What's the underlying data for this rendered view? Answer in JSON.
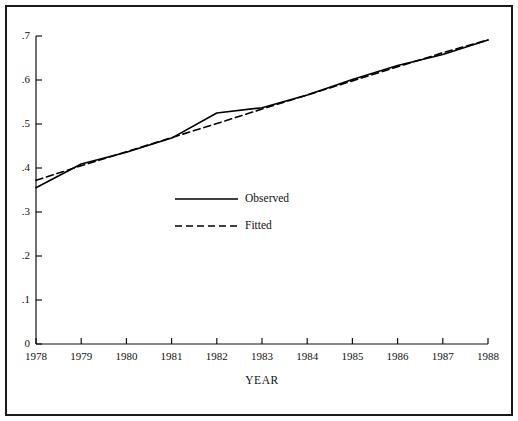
{
  "figure": {
    "border_color": "#1a1a1a",
    "background": "#ffffff",
    "line_color": "#000000"
  },
  "axis_titles": {
    "x": "YEAR",
    "y": ""
  },
  "legend": {
    "observed_label": "Observed",
    "fitted_label": "Fitted"
  },
  "chart_data": {
    "type": "line",
    "title": "",
    "subtitle": "",
    "xlabel": "YEAR",
    "ylabel": "",
    "grid": false,
    "legend_position": "center-left",
    "xlim": [
      1978,
      1988
    ],
    "ylim": [
      0,
      0.7
    ],
    "x": [
      1978,
      1979,
      1980,
      1981,
      1982,
      1983,
      1984,
      1985,
      1986,
      1987,
      1988
    ],
    "xtick_labels": [
      "1978",
      "1979",
      "1980",
      "1981",
      "1982",
      "1983",
      "1984",
      "1985",
      "1986",
      "1987",
      "1988"
    ],
    "ytick_values": [
      0,
      0.1,
      0.2,
      0.3,
      0.4,
      0.5,
      0.6,
      0.7
    ],
    "ytick_labels": [
      "0",
      ".1",
      ".2",
      ".3",
      ".4",
      ".5",
      ".6",
      ".7"
    ],
    "series": [
      {
        "name": "Observed",
        "style": "solid",
        "color": "#000000",
        "values": [
          0.355,
          0.409,
          0.436,
          0.468,
          0.525,
          0.537,
          0.566,
          0.601,
          0.633,
          0.658,
          0.691
        ]
      },
      {
        "name": "Fitted",
        "style": "dashed",
        "color": "#000000",
        "values": [
          0.372,
          0.405,
          0.437,
          0.469,
          0.501,
          0.534,
          0.566,
          0.598,
          0.63,
          0.662,
          0.691
        ]
      }
    ]
  }
}
